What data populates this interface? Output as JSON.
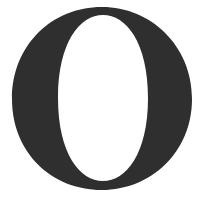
{
  "glyph": {
    "character": "O",
    "style": "serif",
    "color": "#2f2f2f",
    "background": "#ffffff"
  }
}
